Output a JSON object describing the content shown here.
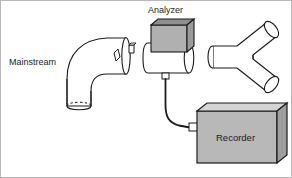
{
  "figure": {
    "type": "technical-line-diagram",
    "background_color": "#ffffff",
    "border_color": "#b9b9b9",
    "stroke_color": "#1a1a1a",
    "width": 292,
    "height": 178
  },
  "labels": {
    "mainstream": "Mainstream",
    "analyzer": "Analyzer",
    "recorder": "Recorder"
  },
  "components": {
    "elbow_tube": {
      "name": "Mainstream",
      "shape": "90-degree elbow tube",
      "fill": "#ffffff",
      "open_end_style": "dashed-ellipse"
    },
    "analyzer_unit": {
      "name": "Analyzer",
      "shape": "gray box on horizontal cylinder",
      "box_front_fill": "#b0b0b0",
      "box_top_fill": "#8f8f8f",
      "box_side_fill": "#9a9a9a",
      "cylinder_fill": "#ffffff"
    },
    "y_connector": {
      "name": "Y connector",
      "shape": "Y-shaped branching tube",
      "fill": "#ffffff",
      "branches": 2
    },
    "recorder_unit": {
      "name": "Recorder",
      "shape": "3D rectangular box",
      "front_fill": "#b8b8b8",
      "top_fill": "#d4d4d4",
      "side_fill": "#9e9e9e"
    },
    "cable": {
      "name": "signal cable",
      "from": "Analyzer",
      "to": "Recorder",
      "color": "#1a1a1a"
    }
  }
}
